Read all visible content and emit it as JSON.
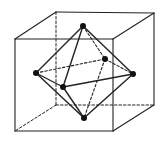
{
  "diagram": {
    "title": "Octahedron inscribed in a cube",
    "stroke_color": "#222222",
    "vertex_color": "#111111",
    "cube": {
      "corners": {
        "front_top_left": [
          15,
          39
        ],
        "front_top_right": [
          113,
          39
        ],
        "front_bottom_right": [
          113,
          131
        ],
        "front_bottom_left": [
          15,
          131
        ],
        "back_top_left": [
          56,
          12
        ],
        "back_top_right": [
          154,
          13
        ],
        "back_bottom_right": [
          154,
          105
        ],
        "back_bottom_left": [
          56,
          105
        ]
      },
      "solid_edges": [
        [
          "front_top_left",
          "front_top_right"
        ],
        [
          "front_top_right",
          "front_bottom_right"
        ],
        [
          "front_bottom_right",
          "front_bottom_left"
        ],
        [
          "front_bottom_left",
          "front_top_left"
        ],
        [
          "back_top_left",
          "back_top_right"
        ],
        [
          "back_top_right",
          "back_bottom_right"
        ],
        [
          "front_top_left",
          "back_top_left"
        ],
        [
          "front_top_right",
          "back_top_right"
        ],
        [
          "front_bottom_right",
          "back_bottom_right"
        ]
      ],
      "dashed_edges": [
        [
          "back_top_left",
          "back_bottom_left"
        ],
        [
          "back_bottom_left",
          "back_bottom_right"
        ],
        [
          "back_bottom_left",
          "front_bottom_left"
        ]
      ]
    },
    "octahedron": {
      "vertices": {
        "top": [
          83,
          26
        ],
        "bottom": [
          84,
          118
        ],
        "left": [
          36,
          73
        ],
        "right": [
          133,
          74
        ],
        "front": [
          63,
          87
        ],
        "back": [
          105,
          59
        ]
      },
      "solid_edges": [
        [
          "top",
          "left"
        ],
        [
          "top",
          "front"
        ],
        [
          "top",
          "right"
        ],
        [
          "left",
          "front"
        ],
        [
          "front",
          "right"
        ],
        [
          "left",
          "bottom"
        ],
        [
          "front",
          "bottom"
        ],
        [
          "right",
          "bottom"
        ]
      ],
      "dashed_edges": [
        [
          "top",
          "back"
        ],
        [
          "left",
          "back"
        ],
        [
          "back",
          "right"
        ],
        [
          "back",
          "bottom"
        ]
      ]
    }
  }
}
